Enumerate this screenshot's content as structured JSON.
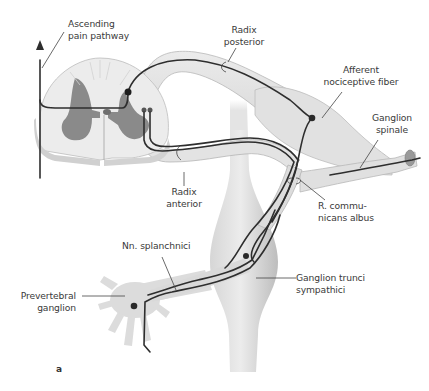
{
  "figure": {
    "panel_letter": "a",
    "colors": {
      "tissue": "#e2e2e2",
      "tissue_shadow": "#c8c8c8",
      "gray_matter": "#8a8a8a",
      "nerve_fiber": "#2e2e2e",
      "label_text": "#3a3a3a",
      "leader_line": "#444444",
      "prevertebral_ganglion": "#dcdcdc"
    }
  },
  "labels": {
    "ascending_pain_pathway": {
      "line1": "Ascending",
      "line2": "pain pathway"
    },
    "radix_posterior": {
      "line1": "Radix",
      "line2": "posterior"
    },
    "afferent_nociceptive_fiber": {
      "line1": "Afferent",
      "line2": "nociceptive fiber"
    },
    "ganglion_spinale": {
      "line1": "Ganglion",
      "line2": "spinale"
    },
    "radix_anterior": {
      "line1": "Radix",
      "line2": "anterior"
    },
    "r_communicans_albus": {
      "line1": "R. commu-",
      "line2": "nicans albus"
    },
    "nn_splanchnici": {
      "line1": "Nn. splanchnici"
    },
    "ganglion_trunci_sympathici": {
      "line1": "Ganglion trunci",
      "line2": "sympathici"
    },
    "prevertebral_ganglion": {
      "line1": "Prevertebral",
      "line2": "ganglion"
    }
  }
}
